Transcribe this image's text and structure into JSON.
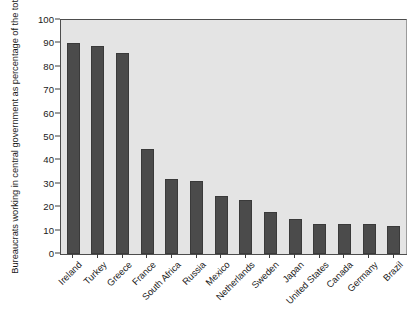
{
  "chart_data": {
    "type": "bar",
    "title": "",
    "xlabel": "",
    "ylabel": "Bureaucrats working in central government as percentage of the total",
    "ylim": [
      0,
      100
    ],
    "yticks": [
      0,
      10,
      20,
      30,
      40,
      50,
      60,
      70,
      80,
      90,
      100
    ],
    "ytick_labels": [
      "0",
      "10",
      "20",
      "30",
      "40",
      "50",
      "60",
      "70",
      "80",
      "90",
      "100"
    ],
    "grid": false,
    "legend": "none",
    "bar_color": "#4b4b4b",
    "plot_background": "#e4e4e4",
    "axis_color": "#3c3c3c",
    "categories": [
      "Ireland",
      "Turkey",
      "Greece",
      "France",
      "South Africa",
      "Russia",
      "Mexico",
      "Netherlands",
      "Sweden",
      "Japan",
      "United States",
      "Canada",
      "Germany",
      "Brazil"
    ],
    "values": [
      90,
      89,
      86,
      45,
      32,
      31,
      25,
      23,
      18,
      15,
      13,
      13,
      13,
      12
    ]
  }
}
